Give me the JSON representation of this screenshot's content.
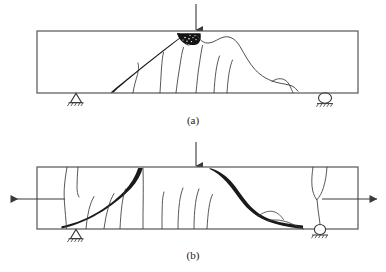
{
  "figure": {
    "background_color": "#ffffff",
    "line_color": "#3a3a3a",
    "crack_color": "#1a1a1a",
    "crush_zone_color": "#111111",
    "panels": [
      {
        "id": "a",
        "caption": "(a)",
        "description": "Simply supported beam with single point load showing diagonal shear-compression crack and concrete crushing zone under the load",
        "beam": {
          "x": 37,
          "y": 31,
          "width": 321,
          "height": 62
        },
        "load": {
          "label": "point-load-arrow",
          "x": 196,
          "y_top": 4,
          "y_bottom": 31,
          "direction": "down"
        },
        "supports": [
          {
            "type": "pin",
            "name": "pin-support",
            "x": 76,
            "y": 93
          },
          {
            "type": "roller",
            "name": "roller-support",
            "x": 325,
            "y": 93
          }
        ],
        "crush_zone": {
          "name": "concrete-crushing-zone",
          "x": 178,
          "y": 33,
          "width": 24,
          "height": 11
        },
        "major_crack": {
          "name": "diagonal-shear-crack",
          "from_x": 110,
          "from_y": 92,
          "to_x": 192,
          "to_y": 35
        }
      },
      {
        "id": "b",
        "caption": "(b)",
        "description": "Beam under point load with axial tension showing two thick diagonal shear cracks and distributed flexural cracks",
        "beam": {
          "x": 37,
          "y": 167,
          "width": 321,
          "height": 62
        },
        "load": {
          "label": "point-load-arrow",
          "x": 196,
          "y_top": 142,
          "y_bottom": 167,
          "direction": "down"
        },
        "supports": [
          {
            "type": "pin",
            "name": "pin-support",
            "x": 76,
            "y": 229
          },
          {
            "type": "roller",
            "name": "roller-support",
            "x": 320,
            "y": 229
          }
        ],
        "axial_arrows": [
          {
            "name": "axial-tension-arrow-left",
            "direction": "left",
            "x_start": 65,
            "x_end": 10,
            "y": 199
          },
          {
            "name": "axial-tension-arrow-right",
            "direction": "right",
            "x_start": 322,
            "x_end": 378,
            "y": 199
          }
        ],
        "major_cracks": [
          {
            "name": "diagonal-shear-crack-left",
            "from_x": 62,
            "from_y": 228,
            "to_x": 143,
            "to_y": 168
          },
          {
            "name": "diagonal-shear-crack-right",
            "from_x": 210,
            "from_y": 169,
            "to_x": 303,
            "to_y": 228
          }
        ]
      }
    ]
  }
}
